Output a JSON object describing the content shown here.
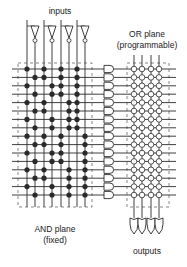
{
  "labels": {
    "inputs": "inputs",
    "or_plane_line1": "OR plane",
    "or_plane_line2": "(programmable)",
    "and_plane_line1": "AND plane",
    "and_plane_line2": "(fixed)",
    "outputs": "outputs"
  },
  "colors": {
    "line": "#2a2a2a",
    "dashed_box": "#555555",
    "background": "#ffffff"
  },
  "and_plane": {
    "input_count": 4,
    "column_x": [
      27,
      35,
      44,
      52,
      61,
      69,
      77,
      85
    ],
    "row_y_start": 69,
    "row_spacing": 8.4,
    "row_count": 16,
    "connections": [
      [
        1,
        0,
        1,
        0,
        1,
        0,
        1,
        0
      ],
      [
        0,
        1,
        1,
        0,
        1,
        0,
        1,
        0
      ],
      [
        1,
        0,
        0,
        1,
        1,
        0,
        1,
        0
      ],
      [
        0,
        1,
        0,
        1,
        1,
        0,
        1,
        0
      ],
      [
        1,
        0,
        1,
        0,
        0,
        1,
        1,
        0
      ],
      [
        0,
        1,
        1,
        0,
        0,
        1,
        1,
        0
      ],
      [
        1,
        0,
        0,
        1,
        0,
        1,
        1,
        0
      ],
      [
        0,
        1,
        0,
        1,
        0,
        1,
        1,
        0
      ],
      [
        1,
        0,
        1,
        0,
        1,
        0,
        0,
        1
      ],
      [
        0,
        1,
        1,
        0,
        1,
        0,
        0,
        1
      ],
      [
        1,
        0,
        0,
        1,
        1,
        0,
        0,
        1
      ],
      [
        0,
        1,
        0,
        1,
        1,
        0,
        0,
        1
      ],
      [
        1,
        0,
        1,
        0,
        0,
        1,
        0,
        1
      ],
      [
        0,
        1,
        1,
        0,
        0,
        1,
        0,
        1
      ],
      [
        1,
        0,
        0,
        1,
        0,
        1,
        0,
        1
      ],
      [
        0,
        1,
        0,
        1,
        0,
        1,
        0,
        1
      ]
    ]
  },
  "or_plane": {
    "output_count": 4,
    "column_x": [
      134,
      142,
      151,
      159
    ],
    "fuse_type": "hollow-circle"
  }
}
